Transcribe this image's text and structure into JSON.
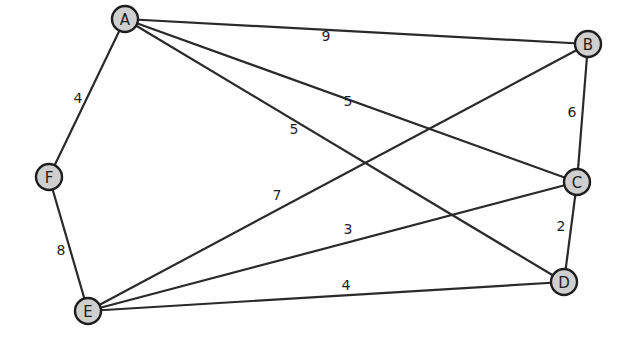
{
  "graph": {
    "nodes": [
      {
        "id": "A",
        "label": "A",
        "x": 125,
        "y": 19
      },
      {
        "id": "B",
        "label": "B",
        "x": 588,
        "y": 44
      },
      {
        "id": "C",
        "label": "C",
        "x": 577,
        "y": 182
      },
      {
        "id": "D",
        "label": "D",
        "x": 564,
        "y": 282
      },
      {
        "id": "E",
        "label": "E",
        "x": 88,
        "y": 311
      },
      {
        "id": "F",
        "label": "F",
        "x": 49,
        "y": 177
      }
    ],
    "edges": [
      {
        "from": "A",
        "to": "B",
        "weight": "9",
        "lx": 326,
        "ly": 36
      },
      {
        "from": "A",
        "to": "C",
        "weight": "5",
        "lx": 348,
        "ly": 101
      },
      {
        "from": "A",
        "to": "D",
        "weight": "5",
        "lx": 294,
        "ly": 129
      },
      {
        "from": "A",
        "to": "F",
        "weight": "4",
        "lx": 78,
        "ly": 98
      },
      {
        "from": "B",
        "to": "C",
        "weight": "6",
        "lx": 572,
        "ly": 112
      },
      {
        "from": "B",
        "to": "E",
        "weight": "7",
        "lx": 277,
        "ly": 195
      },
      {
        "from": "C",
        "to": "D",
        "weight": "2",
        "lx": 561,
        "ly": 226
      },
      {
        "from": "C",
        "to": "E",
        "weight": "3",
        "lx": 348,
        "ly": 229
      },
      {
        "from": "D",
        "to": "E",
        "weight": "4",
        "lx": 346,
        "ly": 285
      },
      {
        "from": "F",
        "to": "E",
        "weight": "8",
        "lx": 61,
        "ly": 250
      }
    ]
  }
}
